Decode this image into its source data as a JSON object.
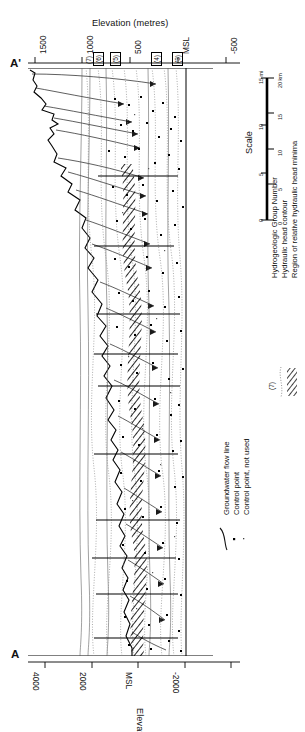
{
  "figure": {
    "kind": "hydrogeologic-cross-section",
    "orientation": "rotated-90-counterclockwise",
    "section_label_top": "A'",
    "section_label_bottom": "A"
  },
  "top_axis": {
    "title": "Elevation (metres)",
    "ticks": [
      "1500",
      "1000",
      "500",
      "MSL",
      "-500"
    ]
  },
  "bottom_axis": {
    "title": "Elevation (feet)",
    "ticks": [
      "4000",
      "2000",
      "MSL",
      "-2000"
    ]
  },
  "group_labels": [
    "(7)",
    "(6)",
    "(5)",
    "(4)",
    "(3)"
  ],
  "scale": {
    "title": "Scale",
    "miles_unit": "15 mi",
    "km_unit": "20 km",
    "miles_ticks": [
      "0",
      "5",
      "10",
      "15"
    ],
    "km_ticks": [
      "0",
      "5",
      "10",
      "15",
      "20"
    ]
  },
  "legend": {
    "items": [
      {
        "symbol": "flow-line",
        "label": "Groundwater flow line"
      },
      {
        "symbol": "dot",
        "label": "Control point"
      },
      {
        "symbol": "small-dot",
        "label": "Control point, not used"
      },
      {
        "symbol": "group-number",
        "label": "Hydrogeologic Group Number"
      },
      {
        "symbol": "dotted-line",
        "label": "Hydraulic head contour"
      },
      {
        "symbol": "hatch",
        "label": "Region of relative hydraulic head minima"
      }
    ],
    "group_number_symbol": "(7)"
  },
  "colors": {
    "ink": "#111111",
    "contour": "#8a8a8a",
    "unit": "#555555",
    "background": "#ffffff"
  },
  "contour_labels": [
    "1500",
    "1000",
    "500",
    "MSL",
    "-500"
  ]
}
